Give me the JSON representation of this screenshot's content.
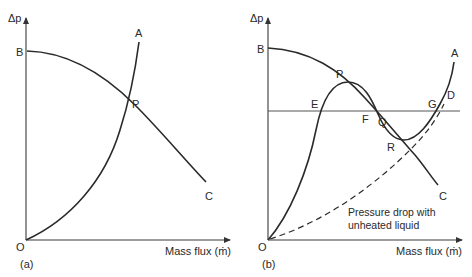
{
  "panel_a": {
    "caption": "(a)",
    "y_axis_label": "Δp",
    "x_axis_label": "Mass flux (ṁ)",
    "points": {
      "B": "B",
      "A": "A",
      "P": "P",
      "C": "C",
      "O": "O"
    }
  },
  "panel_b": {
    "caption": "(b)",
    "y_axis_label": "Δp",
    "x_axis_label": "Mass flux (ṁ)",
    "points": {
      "B": "B",
      "A": "A",
      "P": "P",
      "C": "C",
      "O": "O",
      "E": "E",
      "F": "F",
      "Q": "Q",
      "R": "R",
      "G": "G",
      "D": "D"
    },
    "annotation_line1": "Pressure drop with",
    "annotation_line2": "unheated liquid"
  }
}
